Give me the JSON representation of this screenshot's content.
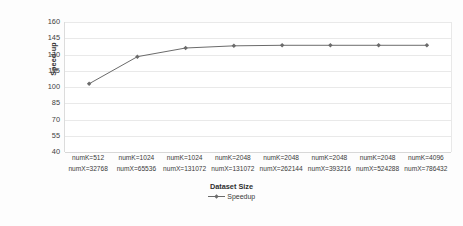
{
  "chart_data": {
    "type": "line",
    "title": "",
    "xlabel": "Dataset Size",
    "ylabel": "Speed-up",
    "ylim": [
      40,
      160
    ],
    "ytick_step": 15,
    "yticks": [
      160,
      145,
      130,
      115,
      100,
      85,
      70,
      55,
      40
    ],
    "grid": true,
    "legend_position": "bottom",
    "categories": [
      "numK=512\nnumX=32768",
      "numK=1024\nnumX=65536",
      "numK=1024\nnumX=131072",
      "numK=2048\nnumX=131072",
      "numK=2048\nnumX=262144",
      "numK=2048\nnumX=393216",
      "numK=2048\nnumX=524288",
      "numK=4096\nnumX=786432"
    ],
    "category_lines": [
      {
        "line1": "numK=512",
        "line2": "numX=32768"
      },
      {
        "line1": "numK=1024",
        "line2": "numX=65536"
      },
      {
        "line1": "numK=1024",
        "line2": "numX=131072"
      },
      {
        "line1": "numK=2048",
        "line2": "numX=131072"
      },
      {
        "line1": "numK=2048",
        "line2": "numX=262144"
      },
      {
        "line1": "numK=2048",
        "line2": "numX=393216"
      },
      {
        "line1": "numK=2048",
        "line2": "numX=524288"
      },
      {
        "line1": "numK=4096",
        "line2": "numX=786432"
      }
    ],
    "series": [
      {
        "name": "Speedup",
        "color": "#6b6b6b",
        "marker": "diamond",
        "values": [
          103,
          128,
          136,
          138,
          138.5,
          138.5,
          138.5,
          138.5
        ]
      }
    ]
  },
  "legend": {
    "entries": [
      {
        "label": "Speedup",
        "icon": "line-marker-icon"
      }
    ]
  },
  "axis": {
    "x_title": "Dataset Size",
    "y_title": "Speed-up"
  }
}
